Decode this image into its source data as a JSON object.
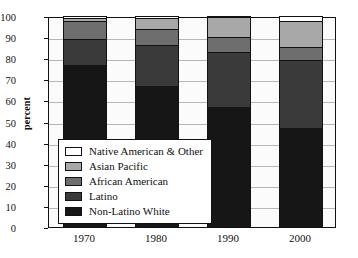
{
  "chart_data": {
    "type": "bar",
    "stacked": true,
    "title": "",
    "xlabel": "",
    "ylabel": "percent",
    "ylim": [
      0,
      100
    ],
    "yticks": [
      0,
      10,
      20,
      30,
      40,
      50,
      60,
      70,
      80,
      90,
      100
    ],
    "categories": [
      "1970",
      "1980",
      "1990",
      "2000"
    ],
    "grid": true,
    "legend_position": "inside-lower-left",
    "series": [
      {
        "name": "Non-Latino White",
        "color": "#161616",
        "values": [
          77,
          67,
          57,
          47
        ]
      },
      {
        "name": "Latino",
        "color": "#3a3a3a",
        "values": [
          12,
          19.5,
          26,
          32
        ]
      },
      {
        "name": "African American",
        "color": "#6e6e6e",
        "values": [
          8.5,
          7.5,
          7,
          6.5
        ]
      },
      {
        "name": "Asian Pacific",
        "color": "#a8a8a8",
        "values": [
          1.5,
          5,
          9.5,
          12
        ]
      },
      {
        "name": "Native American & Other",
        "color": "#ffffff",
        "values": [
          1,
          1,
          0.5,
          2.5
        ]
      }
    ],
    "legend_order": [
      "Native American & Other",
      "Asian Pacific",
      "African American",
      "Latino",
      "Non-Latino White"
    ],
    "cumulative_tops": {
      "1970": [
        77,
        89,
        97.5,
        99,
        100
      ],
      "1980": [
        67,
        86.5,
        94,
        99,
        100
      ],
      "1990": [
        57,
        83,
        90,
        99.5,
        100
      ],
      "2000": [
        47,
        79,
        85.5,
        97.5,
        100
      ]
    }
  },
  "colors": {
    "axis": "#111111",
    "grid": "#b8b8b8",
    "plot_background": "#fbfbfb",
    "page_background": "#ffffff"
  }
}
